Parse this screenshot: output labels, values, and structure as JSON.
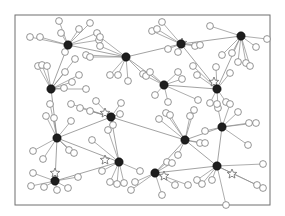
{
  "diagram": {
    "type": "network",
    "frame": {
      "x": 15,
      "y": 15,
      "w": 255,
      "h": 190,
      "stroke": "#6f6f6f"
    },
    "colors": {
      "edge": "#8a8a8a",
      "hub": "#1e1e1e",
      "leaf_stroke": "#7a7a7a",
      "leaf_fill": "#ffffff",
      "star_stroke": "#6a6a6a"
    },
    "hubs": [
      {
        "id": "h1",
        "x": 68,
        "y": 45
      },
      {
        "id": "h2",
        "x": 126,
        "y": 57
      },
      {
        "id": "h3",
        "x": 181,
        "y": 44
      },
      {
        "id": "h4",
        "x": 241,
        "y": 36
      },
      {
        "id": "h5",
        "x": 51,
        "y": 89
      },
      {
        "id": "h6",
        "x": 164,
        "y": 85
      },
      {
        "id": "h7",
        "x": 217,
        "y": 89
      },
      {
        "id": "h8",
        "x": 57,
        "y": 138
      },
      {
        "id": "h9",
        "x": 111,
        "y": 117
      },
      {
        "id": "h10",
        "x": 119,
        "y": 162
      },
      {
        "id": "h11",
        "x": 185,
        "y": 140
      },
      {
        "id": "h12",
        "x": 222,
        "y": 127
      },
      {
        "id": "h13",
        "x": 55,
        "y": 181
      },
      {
        "id": "h14",
        "x": 155,
        "y": 173
      },
      {
        "id": "h15",
        "x": 217,
        "y": 166
      }
    ],
    "stars": [
      {
        "x": 182,
        "y": 43
      },
      {
        "x": 214,
        "y": 82
      },
      {
        "x": 105,
        "y": 113
      },
      {
        "x": 105,
        "y": 160
      },
      {
        "x": 55,
        "y": 173
      },
      {
        "x": 164,
        "y": 176
      },
      {
        "x": 232,
        "y": 174
      }
    ],
    "leaves": [
      {
        "x": 30,
        "y": 37,
        "h": "h1"
      },
      {
        "x": 40,
        "y": 37,
        "h": "h1"
      },
      {
        "x": 59,
        "y": 21,
        "h": "h1"
      },
      {
        "x": 61,
        "y": 33,
        "h": "h1"
      },
      {
        "x": 79,
        "y": 29,
        "h": "h1"
      },
      {
        "x": 90,
        "y": 23,
        "h": "h1"
      },
      {
        "x": 65,
        "y": 52,
        "h": "h1"
      },
      {
        "x": 97,
        "y": 33,
        "h": "h1"
      },
      {
        "x": 99,
        "y": 40,
        "h": "h1"
      },
      {
        "x": 100,
        "y": 37,
        "h": "h2"
      },
      {
        "x": 86,
        "y": 55,
        "h": "h2"
      },
      {
        "x": 90,
        "y": 57,
        "h": "h2"
      },
      {
        "x": 110,
        "y": 75,
        "h": "h2"
      },
      {
        "x": 118,
        "y": 75,
        "h": "h2"
      },
      {
        "x": 143,
        "y": 74,
        "h": "h2"
      },
      {
        "x": 128,
        "y": 81,
        "h": "h2"
      },
      {
        "x": 100,
        "y": 46,
        "h": "h2"
      },
      {
        "x": 152,
        "y": 31,
        "h": "h3"
      },
      {
        "x": 157,
        "y": 29,
        "h": "h3"
      },
      {
        "x": 162,
        "y": 22,
        "h": "h3"
      },
      {
        "x": 168,
        "y": 49,
        "h": "h3"
      },
      {
        "x": 178,
        "y": 52,
        "h": "h3"
      },
      {
        "x": 195,
        "y": 46,
        "h": "h3"
      },
      {
        "x": 200,
        "y": 45,
        "h": "h3"
      },
      {
        "x": 210,
        "y": 26,
        "h": "h4"
      },
      {
        "x": 267,
        "y": 39,
        "h": "h4"
      },
      {
        "x": 256,
        "y": 47,
        "h": "h4"
      },
      {
        "x": 232,
        "y": 53,
        "h": "h4"
      },
      {
        "x": 238,
        "y": 62,
        "h": "h4"
      },
      {
        "x": 246,
        "y": 63,
        "h": "h4"
      },
      {
        "x": 250,
        "y": 66,
        "h": "h4"
      },
      {
        "x": 222,
        "y": 55,
        "h": "h4"
      },
      {
        "x": 38,
        "y": 66,
        "h": "h5"
      },
      {
        "x": 42,
        "y": 65,
        "h": "h5"
      },
      {
        "x": 47,
        "y": 66,
        "h": "h5"
      },
      {
        "x": 75,
        "y": 59,
        "h": "h5"
      },
      {
        "x": 65,
        "y": 72,
        "h": "h5"
      },
      {
        "x": 79,
        "y": 75,
        "h": "h5"
      },
      {
        "x": 72,
        "y": 82,
        "h": "h5"
      },
      {
        "x": 64,
        "y": 88,
        "h": "h5"
      },
      {
        "x": 86,
        "y": 89,
        "h": "h5"
      },
      {
        "x": 146,
        "y": 76,
        "h": "h6"
      },
      {
        "x": 150,
        "y": 72,
        "h": "h6"
      },
      {
        "x": 178,
        "y": 72,
        "h": "h6"
      },
      {
        "x": 182,
        "y": 79,
        "h": "h6"
      },
      {
        "x": 198,
        "y": 100,
        "h": "h6"
      },
      {
        "x": 155,
        "y": 95,
        "h": "h6"
      },
      {
        "x": 168,
        "y": 102,
        "h": "h6"
      },
      {
        "x": 193,
        "y": 66,
        "h": "h7"
      },
      {
        "x": 197,
        "y": 75,
        "h": "h7"
      },
      {
        "x": 216,
        "y": 67,
        "h": "h7"
      },
      {
        "x": 230,
        "y": 73,
        "h": "h7"
      },
      {
        "x": 210,
        "y": 103,
        "h": "h7"
      },
      {
        "x": 218,
        "y": 108,
        "h": "h7"
      },
      {
        "x": 226,
        "y": 102,
        "h": "h7"
      },
      {
        "x": 33,
        "y": 151,
        "h": "h8"
      },
      {
        "x": 43,
        "y": 159,
        "h": "h8"
      },
      {
        "x": 46,
        "y": 116,
        "h": "h8"
      },
      {
        "x": 50,
        "y": 104,
        "h": "h8"
      },
      {
        "x": 54,
        "y": 118,
        "h": "h8"
      },
      {
        "x": 71,
        "y": 121,
        "h": "h8"
      },
      {
        "x": 69,
        "y": 150,
        "h": "h8"
      },
      {
        "x": 74,
        "y": 153,
        "h": "h8"
      },
      {
        "x": 71,
        "y": 104,
        "h": "h9"
      },
      {
        "x": 80,
        "y": 108,
        "h": "h9"
      },
      {
        "x": 90,
        "y": 111,
        "h": "h9"
      },
      {
        "x": 96,
        "y": 101,
        "h": "h9"
      },
      {
        "x": 121,
        "y": 103,
        "h": "h9"
      },
      {
        "x": 113,
        "y": 125,
        "h": "h9"
      },
      {
        "x": 120,
        "y": 114,
        "h": "h9"
      },
      {
        "x": 108,
        "y": 130,
        "h": "h10"
      },
      {
        "x": 92,
        "y": 140,
        "h": "h10"
      },
      {
        "x": 102,
        "y": 171,
        "h": "h10"
      },
      {
        "x": 110,
        "y": 182,
        "h": "h10"
      },
      {
        "x": 117,
        "y": 184,
        "h": "h10"
      },
      {
        "x": 124,
        "y": 183,
        "h": "h10"
      },
      {
        "x": 140,
        "y": 171,
        "h": "h10"
      },
      {
        "x": 159,
        "y": 119,
        "h": "h11"
      },
      {
        "x": 166,
        "y": 113,
        "h": "h11"
      },
      {
        "x": 170,
        "y": 115,
        "h": "h11"
      },
      {
        "x": 190,
        "y": 116,
        "h": "h11"
      },
      {
        "x": 194,
        "y": 110,
        "h": "h11"
      },
      {
        "x": 200,
        "y": 143,
        "h": "h11"
      },
      {
        "x": 205,
        "y": 143,
        "h": "h11"
      },
      {
        "x": 178,
        "y": 155,
        "h": "h11"
      },
      {
        "x": 217,
        "y": 104,
        "h": "h12"
      },
      {
        "x": 230,
        "y": 104,
        "h": "h12"
      },
      {
        "x": 238,
        "y": 112,
        "h": "h12"
      },
      {
        "x": 249,
        "y": 123,
        "h": "h12"
      },
      {
        "x": 256,
        "y": 123,
        "h": "h12"
      },
      {
        "x": 248,
        "y": 145,
        "h": "h12"
      },
      {
        "x": 205,
        "y": 131,
        "h": "h12"
      },
      {
        "x": 33,
        "y": 173,
        "h": "h13"
      },
      {
        "x": 44,
        "y": 187,
        "h": "h13"
      },
      {
        "x": 57,
        "y": 190,
        "h": "h13"
      },
      {
        "x": 68,
        "y": 188,
        "h": "h13"
      },
      {
        "x": 78,
        "y": 177,
        "h": "h13"
      },
      {
        "x": 31,
        "y": 186,
        "h": "h13"
      },
      {
        "x": 131,
        "y": 190,
        "h": "h14"
      },
      {
        "x": 135,
        "y": 182,
        "h": "h14"
      },
      {
        "x": 167,
        "y": 162,
        "h": "h14"
      },
      {
        "x": 172,
        "y": 163,
        "h": "h14"
      },
      {
        "x": 175,
        "y": 185,
        "h": "h14"
      },
      {
        "x": 188,
        "y": 185,
        "h": "h14"
      },
      {
        "x": 162,
        "y": 195,
        "h": "h14"
      },
      {
        "x": 197,
        "y": 180,
        "h": "h15"
      },
      {
        "x": 202,
        "y": 184,
        "h": "h15"
      },
      {
        "x": 212,
        "y": 180,
        "h": "h15"
      },
      {
        "x": 226,
        "y": 205,
        "h": "h15"
      },
      {
        "x": 263,
        "y": 164,
        "h": "h15"
      },
      {
        "x": 257,
        "y": 185,
        "h": "h15"
      },
      {
        "x": 263,
        "y": 188,
        "h": "h15"
      }
    ],
    "hub_links": [
      [
        "h1",
        "h2"
      ],
      [
        "h1",
        "h5"
      ],
      [
        "h2",
        "h3"
      ],
      [
        "h3",
        "h4"
      ],
      [
        "h3",
        "h7"
      ],
      [
        "h4",
        "h7"
      ],
      [
        "h2",
        "h6"
      ],
      [
        "h5",
        "h8"
      ],
      [
        "h8",
        "h9"
      ],
      [
        "h9",
        "h10"
      ],
      [
        "h8",
        "h13"
      ],
      [
        "h9",
        "h11"
      ],
      [
        "h10",
        "h13"
      ],
      [
        "h11",
        "h12"
      ],
      [
        "h11",
        "h14"
      ],
      [
        "h14",
        "h15"
      ],
      [
        "h15",
        "h12"
      ],
      [
        "h6",
        "h7"
      ],
      [
        "h11",
        "h15"
      ],
      [
        "h10",
        "h8"
      ]
    ]
  }
}
